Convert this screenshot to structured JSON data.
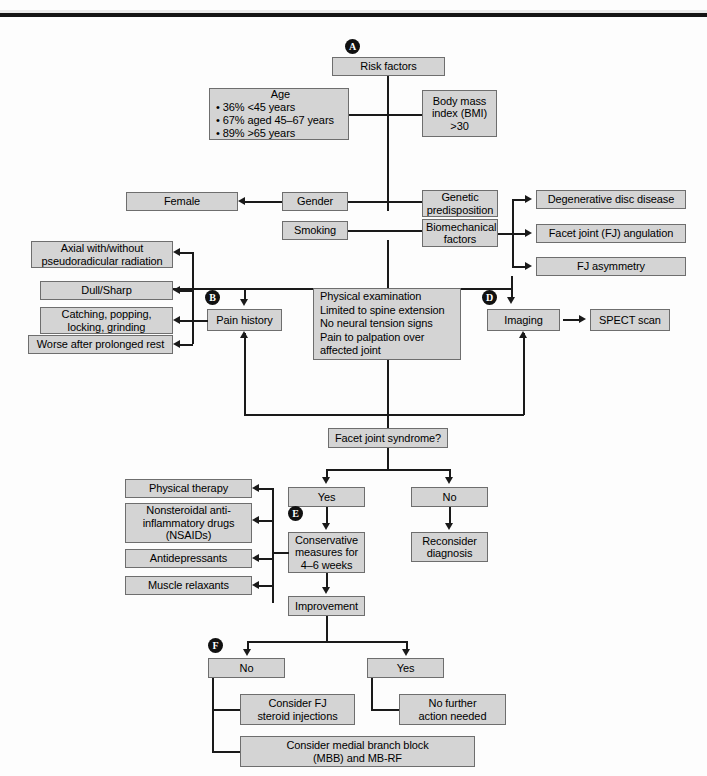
{
  "figure": {
    "type": "clinical-algorithm-flowchart",
    "topic": "Facet joint syndrome diagnostic and treatment algorithm"
  },
  "markers": [
    {
      "id": "A",
      "letter": "A"
    },
    {
      "id": "B",
      "letter": "B"
    },
    {
      "id": "C",
      "letter": "C"
    },
    {
      "id": "D",
      "letter": "D"
    },
    {
      "id": "E",
      "letter": "E"
    },
    {
      "id": "F",
      "letter": "F"
    }
  ],
  "nodes": {
    "risk_factors": "Risk factors",
    "age_title": "Age",
    "age_bullets": [
      "• 36% <45 years",
      "• 67% aged 45–67 years",
      "• 89% >65 years"
    ],
    "bmi": "Body mass\nindex (BMI)\n>30",
    "bmi_lines": [
      "Body mass",
      "index (BMI)",
      ">30"
    ],
    "gender": "Gender",
    "female": "Female",
    "smoking": "Smoking",
    "genetic_predisposition_lines": [
      "Genetic",
      "predisposition"
    ],
    "biomechanical_factors_lines": [
      "Biomechanical",
      "factors"
    ],
    "degenerative_disc_disease": "Degenerative disc disease",
    "fj_angulation": "Facet joint (FJ) angulation",
    "fj_asymmetry": "FJ asymmetry",
    "pain_history": "Pain history",
    "axial_radiation_lines": [
      "Axial with/without",
      "pseudoradicular radiation"
    ],
    "dull_sharp": "Dull/Sharp",
    "catching_lines": [
      "Catching, popping,",
      "locking, grinding"
    ],
    "worse_after_rest": "Worse after prolonged rest",
    "physical_exam_lines": [
      "Physical examination",
      "Limited to spine extension",
      "No neural tension signs",
      "Pain to palpation over",
      "affected joint"
    ],
    "imaging": "Imaging",
    "spect_scan": "SPECT scan",
    "facet_joint_syndrome_q": "Facet joint syndrome?",
    "yes_1": "Yes",
    "no_1": "No",
    "reconsider_diagnosis_lines": [
      "Reconsider",
      "diagnosis"
    ],
    "conservative_measures_lines": [
      "Conservative",
      "measures for",
      "4–6 weeks"
    ],
    "physical_therapy": "Physical therapy",
    "nsaids_lines": [
      "Nonsteroidal anti-",
      "inflammatory drugs",
      "(NSAIDs)"
    ],
    "antidepressants": "Antidepressants",
    "muscle_relaxants": "Muscle relaxants",
    "improvement": "Improvement",
    "no_2": "No",
    "yes_2": "Yes",
    "consider_fj_steroid_lines": [
      "Consider FJ",
      "steroid injections"
    ],
    "no_further_action_lines": [
      "No further",
      "action needed"
    ],
    "consider_mbb_lines": [
      "Consider medial branch block",
      "(MBB) and MB-RF"
    ]
  },
  "colors": {
    "box_fill": "#d4d4d4",
    "box_border": "#6e6e6e",
    "shadow": "#111111",
    "line": "#1a1a1a",
    "marker_bg": "#111111",
    "marker_fg": "#ffffff",
    "page_bg": "#fdfdfd"
  }
}
